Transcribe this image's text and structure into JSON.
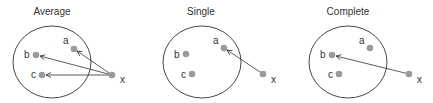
{
  "diagram": {
    "panels": [
      {
        "title": "Average",
        "cluster": {
          "cx": 52,
          "cy": 62,
          "rx": 39,
          "ry": 36
        },
        "points": [
          {
            "label": "a",
            "x": 74,
            "y": 49,
            "lx": 63,
            "ly": 44
          },
          {
            "label": "b",
            "x": 36,
            "y": 55,
            "lx": 24,
            "ly": 55
          },
          {
            "label": "c",
            "x": 42,
            "y": 75,
            "lx": 31,
            "ly": 75
          },
          {
            "label": "x",
            "x": 112,
            "y": 75,
            "lx": 120,
            "ly": 83
          }
        ],
        "arrows": [
          {
            "from": "x",
            "to": "a"
          },
          {
            "from": "x",
            "to": "b"
          },
          {
            "from": "x",
            "to": "c"
          }
        ]
      },
      {
        "title": "Single",
        "cluster": {
          "cx": 202,
          "cy": 62,
          "rx": 39,
          "ry": 36
        },
        "points": [
          {
            "label": "a",
            "x": 224,
            "y": 48,
            "lx": 213,
            "ly": 44
          },
          {
            "label": "b",
            "x": 186,
            "y": 54,
            "lx": 174,
            "ly": 55
          },
          {
            "label": "c",
            "x": 192,
            "y": 74,
            "lx": 181,
            "ly": 75
          },
          {
            "label": "x",
            "x": 263,
            "y": 74,
            "lx": 271,
            "ly": 83
          }
        ],
        "arrows": [
          {
            "from": "x",
            "to": "a"
          }
        ]
      },
      {
        "title": "Complete",
        "cluster": {
          "cx": 348,
          "cy": 62,
          "rx": 39,
          "ry": 36
        },
        "points": [
          {
            "label": "a",
            "x": 370,
            "y": 48,
            "lx": 359,
            "ly": 44
          },
          {
            "label": "b",
            "x": 332,
            "y": 55,
            "lx": 320,
            "ly": 55
          },
          {
            "label": "c",
            "x": 339,
            "y": 74,
            "lx": 328,
            "ly": 75
          },
          {
            "label": "x",
            "x": 409,
            "y": 74,
            "lx": 417,
            "ly": 83
          }
        ],
        "arrows": [
          {
            "from": "x",
            "to": "b"
          }
        ]
      }
    ],
    "title_positions": [
      52,
      201,
      348
    ],
    "colors": {
      "point": "#9a9a9a",
      "stroke": "#333333",
      "background": "#ffffff"
    }
  }
}
